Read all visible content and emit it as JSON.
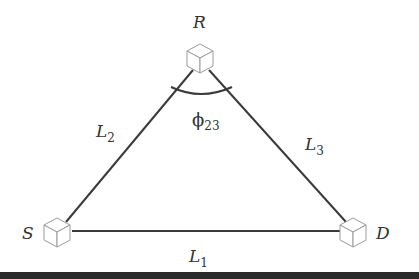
{
  "diagram": {
    "type": "relay-network-triangle",
    "nodes": [
      {
        "id": "R",
        "label": "R",
        "role": "relay"
      },
      {
        "id": "S",
        "label": "S",
        "role": "source"
      },
      {
        "id": "D",
        "label": "D",
        "role": "destination"
      }
    ],
    "edges": [
      {
        "from": "S",
        "to": "D",
        "label_main": "L",
        "label_sub": "1"
      },
      {
        "from": "S",
        "to": "R",
        "label_main": "L",
        "label_sub": "2"
      },
      {
        "from": "R",
        "to": "D",
        "label_main": "L",
        "label_sub": "3"
      }
    ],
    "angle": {
      "at": "R",
      "symbol": "ϕ",
      "sub": "23"
    },
    "colors": {
      "line": "#3a3a3a",
      "cube": "#9a9a9a",
      "text": "#333333",
      "bottom_bar": "#2a2a2a"
    }
  }
}
